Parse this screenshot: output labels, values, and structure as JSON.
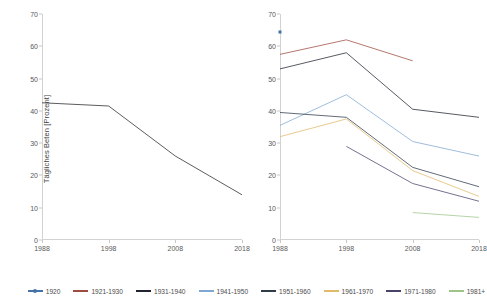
{
  "chart_data": [
    {
      "type": "line",
      "title": "",
      "panel": "left",
      "xlabel": "",
      "ylabel": "Tägliches Beten [Prozent]",
      "categories": [
        "1988",
        "1998",
        "2008",
        "2018"
      ],
      "x": [
        1988,
        1998,
        2008,
        2018
      ],
      "xlim": [
        1988,
        2018
      ],
      "ylim": [
        0,
        70
      ],
      "yticks": [
        0,
        10,
        20,
        30,
        40,
        50,
        60,
        70
      ],
      "grid": false,
      "legend_position": "bottom",
      "series": [
        {
          "name": "Gesamt",
          "color": "#262626",
          "values": [
            42.5,
            41.5,
            26.0,
            14.0
          ]
        }
      ]
    },
    {
      "type": "line",
      "title": "",
      "panel": "right",
      "xlabel": "",
      "ylabel": "",
      "categories": [
        "1988",
        "1998",
        "2008",
        "2018"
      ],
      "x": [
        1988,
        1998,
        2008,
        2018
      ],
      "xlim": [
        1988,
        2018
      ],
      "ylim": [
        0,
        70
      ],
      "yticks": [
        0,
        10,
        20,
        30,
        40,
        50,
        60,
        70
      ],
      "grid": false,
      "legend_position": "bottom",
      "series": [
        {
          "name": "1920",
          "color": "#4472a8",
          "marker": "square",
          "values": [
            64.5,
            null,
            null,
            null
          ]
        },
        {
          "name": "1921-1930",
          "color": "#9e4b40",
          "values": [
            57.5,
            62.0,
            55.5,
            null
          ]
        },
        {
          "name": "1931-1940",
          "color": "#1f2430",
          "values": [
            53.0,
            58.0,
            40.5,
            38.0
          ]
        },
        {
          "name": "1941-1950",
          "color": "#7fa8d0",
          "values": [
            35.5,
            45.0,
            30.5,
            26.0
          ]
        },
        {
          "name": "1951-1960",
          "color": "#2f3a4a",
          "values": [
            39.5,
            38.0,
            22.5,
            16.5
          ]
        },
        {
          "name": "1961-1970",
          "color": "#e0b96a",
          "values": [
            32.0,
            37.5,
            21.5,
            13.5
          ]
        },
        {
          "name": "1971-1980",
          "color": "#48436b",
          "values": [
            null,
            29.0,
            17.5,
            12.0
          ]
        },
        {
          "name": "1981+",
          "color": "#9ec48a",
          "values": [
            null,
            null,
            8.5,
            7.0
          ]
        }
      ]
    }
  ],
  "legend": {
    "items": [
      {
        "label": "1920",
        "color": "#4472a8",
        "marker": true
      },
      {
        "label": "1921-1930",
        "color": "#9e4b40",
        "marker": false
      },
      {
        "label": "1931-1940",
        "color": "#1f2430",
        "marker": false
      },
      {
        "label": "1941-1950",
        "color": "#7fa8d0",
        "marker": false
      },
      {
        "label": "1951-1960",
        "color": "#2f3a4a",
        "marker": false
      },
      {
        "label": "1961-1970",
        "color": "#e0b96a",
        "marker": false
      },
      {
        "label": "1971-1980",
        "color": "#48436b",
        "marker": false
      },
      {
        "label": "1981+",
        "color": "#9ec48a",
        "marker": false
      }
    ]
  }
}
